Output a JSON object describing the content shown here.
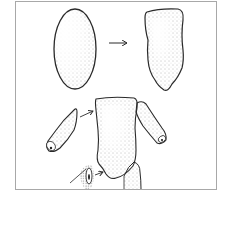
{
  "figure": {
    "steps": [
      {
        "name": "oval-lump"
      },
      {
        "name": "shaped-torso"
      },
      {
        "name": "assembly-with-limbs"
      }
    ],
    "colors": {
      "frame": "#a8a8a8",
      "outline": "#2a2a2a",
      "stipple": "#6a6a6a",
      "background": "#ffffff"
    }
  }
}
